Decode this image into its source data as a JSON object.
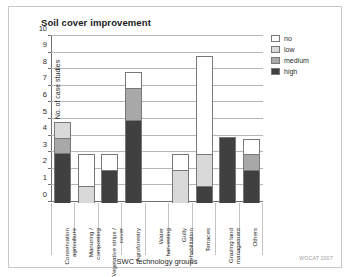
{
  "figure": {
    "title": "Soil cover improvement",
    "credit": "WOCAT 2007"
  },
  "legend": {
    "items": [
      {
        "label": "no",
        "color": "#ffffff"
      },
      {
        "label": "low",
        "color": "#d9d9d9"
      },
      {
        "label": "medium",
        "color": "#a8a8a8"
      },
      {
        "label": "high",
        "color": "#404040"
      }
    ]
  },
  "chart_data": {
    "type": "bar",
    "title": "Soil cover improvement",
    "xlabel": "SWC technology groups",
    "ylabel": "No. of case studies",
    "ylim": [
      0,
      10
    ],
    "yticks": [
      0,
      1,
      2,
      3,
      4,
      5,
      6,
      7,
      8,
      9,
      10
    ],
    "grid": true,
    "stacked": true,
    "legend_position": "right",
    "categories": [
      "Conservation agriculture",
      "Manuring / composting",
      "Vegetative strips / cover",
      "Agroforestry",
      "Water harvesting",
      "Gully rehabilitation",
      "Terraces",
      "Grazing land management",
      "Others"
    ],
    "series": [
      {
        "name": "high",
        "color": "#404040",
        "values": [
          3,
          0,
          2,
          5,
          0,
          0,
          1,
          4,
          2
        ]
      },
      {
        "name": "medium",
        "color": "#a8a8a8",
        "values": [
          1,
          0,
          0,
          2,
          0,
          0,
          0,
          0,
          1
        ]
      },
      {
        "name": "low",
        "color": "#d9d9d9",
        "values": [
          1,
          1,
          0,
          0,
          0,
          2,
          2,
          0,
          0
        ]
      },
      {
        "name": "no",
        "color": "#ffffff",
        "values": [
          0,
          2,
          1,
          1,
          0,
          1,
          6,
          0,
          1
        ]
      }
    ],
    "totals": [
      5,
      3,
      3,
      8,
      0,
      3,
      9,
      4,
      4
    ]
  }
}
